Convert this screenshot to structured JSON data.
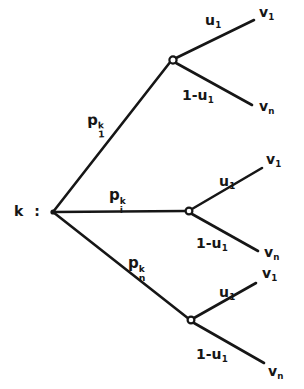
{
  "figure": {
    "background_color": "#ffffff",
    "line_color": "#161616",
    "width": 304,
    "height": 389
  },
  "root": {
    "label": "k :",
    "name": "root-node-k",
    "x": 52,
    "y": 212
  },
  "branches": [
    {
      "id": "branch-1",
      "prob_label": {
        "base": "p",
        "sub": "1",
        "sup": "k",
        "text": "p_1^k"
      },
      "node": {
        "x": 172,
        "y": 60
      },
      "edges": [
        {
          "id": "edge-1-upper",
          "weight_label": {
            "base": "u",
            "sub": "1",
            "text": "u_1"
          },
          "leaf_label": {
            "base": "v",
            "sub": "1",
            "text": "v_1"
          }
        },
        {
          "id": "edge-1-lower",
          "weight_label": {
            "base": "1-u",
            "sub": "1",
            "text": "1-u_1"
          },
          "leaf_label": {
            "base": "v",
            "sub": "n",
            "text": "v_n"
          }
        }
      ]
    },
    {
      "id": "branch-i",
      "prob_label": {
        "base": "p",
        "sub": "i",
        "sup": "k",
        "text": "p_i^k"
      },
      "node": {
        "x": 188,
        "y": 211
      },
      "edges": [
        {
          "id": "edge-i-upper",
          "weight_label": {
            "base": "u",
            "sub": "1",
            "text": "u_1"
          },
          "leaf_label": {
            "base": "v",
            "sub": "1",
            "text": "v_1"
          }
        },
        {
          "id": "edge-i-lower",
          "weight_label": {
            "base": "1-u",
            "sub": "1",
            "text": "1-u_1"
          },
          "leaf_label": {
            "base": "v",
            "sub": "n",
            "text": "v_n"
          }
        }
      ]
    },
    {
      "id": "branch-n",
      "prob_label": {
        "base": "p",
        "sub": "n",
        "sup": "k",
        "text": "p_n^k"
      },
      "node": {
        "x": 190,
        "y": 320
      },
      "edges": [
        {
          "id": "edge-n-upper",
          "weight_label": {
            "base": "u",
            "sub": "1",
            "text": "u_1"
          },
          "leaf_label": {
            "base": "v",
            "sub": "1",
            "text": "v_1"
          }
        },
        {
          "id": "edge-n-lower",
          "weight_label": {
            "base": "1-u",
            "sub": "1",
            "text": "1-u_1"
          },
          "leaf_label": {
            "base": "v",
            "sub": "n",
            "text": "v_n"
          }
        }
      ]
    }
  ],
  "labels": {
    "p1_base": "p",
    "p1_sup": "k",
    "p1_sub": "1",
    "pi_base": "p",
    "pi_sup": "k",
    "pi_sub": "i",
    "pn_base": "p",
    "pn_sup": "k",
    "pn_sub": "n",
    "u_base": "u",
    "u_sub": "1",
    "one_minus_u_base": "1-u",
    "one_minus_u_sub": "1",
    "v1_base": "v",
    "v1_sub": "1",
    "vn_base": "v",
    "vn_sub": "n"
  }
}
